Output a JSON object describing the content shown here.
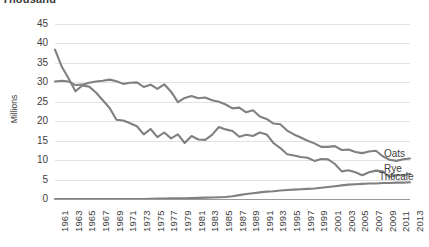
{
  "chart_title": "Thousand",
  "axis": {
    "y_label": "Millions",
    "y_ticks": [
      45,
      40,
      35,
      30,
      25,
      20,
      15,
      10,
      5,
      0
    ],
    "x_ticks": [
      1961,
      1963,
      1965,
      1967,
      1969,
      1971,
      1973,
      1975,
      1977,
      1979,
      1981,
      1983,
      1985,
      1987,
      1989,
      1991,
      1993,
      1995,
      1997,
      1999,
      2001,
      2003,
      2005,
      2007,
      2009,
      2011,
      2013
    ]
  },
  "series_labels": [
    {
      "name": "Oats",
      "text": "Oats"
    },
    {
      "name": "Rye",
      "text": "Rye"
    },
    {
      "name": "Triticale",
      "text": "Triticale"
    }
  ],
  "colors": {
    "line": "#808080",
    "gridline": "#e2e2e2",
    "axis": "#9a9a9a",
    "text": "#3d3d3d",
    "background": "#ffffff"
  },
  "chart_data": {
    "type": "line",
    "title": "Thousand",
    "xlabel": "",
    "ylabel": "Millions",
    "ylim": [
      0,
      45
    ],
    "xlim": [
      1961,
      2013
    ],
    "grid": true,
    "legend": "inline-right-edge",
    "x": [
      1961,
      1962,
      1963,
      1964,
      1965,
      1966,
      1967,
      1968,
      1969,
      1970,
      1971,
      1972,
      1973,
      1974,
      1975,
      1976,
      1977,
      1978,
      1979,
      1980,
      1981,
      1982,
      1983,
      1984,
      1985,
      1986,
      1987,
      1988,
      1989,
      1990,
      1991,
      1992,
      1993,
      1994,
      1995,
      1996,
      1997,
      1998,
      1999,
      2000,
      2001,
      2002,
      2003,
      2004,
      2005,
      2006,
      2007,
      2008,
      2009,
      2010,
      2011,
      2012,
      2013
    ],
    "series": [
      {
        "name": "Oats",
        "values": [
          30.2,
          30.4,
          30.2,
          29.3,
          29.4,
          29.9,
          30.2,
          30.4,
          30.7,
          30.3,
          29.6,
          29.9,
          30.0,
          28.8,
          29.4,
          28.3,
          29.5,
          27.6,
          24.9,
          26.0,
          26.5,
          25.9,
          26.1,
          25.4,
          25.0,
          24.3,
          23.3,
          23.5,
          22.3,
          22.8,
          21.2,
          20.6,
          19.4,
          19.2,
          17.6,
          16.6,
          15.8,
          15.0,
          14.3,
          13.4,
          13.4,
          13.6,
          12.6,
          12.7,
          12.1,
          11.8,
          12.2,
          12.4,
          11.0,
          10.1,
          9.8,
          10.2,
          10.4
        ]
      },
      {
        "name": "Rye",
        "values": [
          38.4,
          34.0,
          31.0,
          27.7,
          29.2,
          28.9,
          27.4,
          25.4,
          23.4,
          20.4,
          20.2,
          19.5,
          18.7,
          16.6,
          18.0,
          15.9,
          17.1,
          15.6,
          16.6,
          14.4,
          16.2,
          15.3,
          15.2,
          16.5,
          18.5,
          17.9,
          17.5,
          16.0,
          16.5,
          16.2,
          17.1,
          16.6,
          14.4,
          13.1,
          11.5,
          11.2,
          10.8,
          10.6,
          9.8,
          10.3,
          10.2,
          9.0,
          7.1,
          7.4,
          6.9,
          6.1,
          6.9,
          7.3,
          7.1,
          5.7,
          6.1,
          6.1,
          6.5
        ]
      },
      {
        "name": "Triticale",
        "values": [
          0.0,
          0.0,
          0.0,
          0.0,
          0.0,
          0.0,
          0.0,
          0.0,
          0.0,
          0.0,
          0.0,
          0.0,
          0.0,
          0.0,
          0.05,
          0.1,
          0.1,
          0.15,
          0.2,
          0.2,
          0.25,
          0.3,
          0.35,
          0.4,
          0.45,
          0.5,
          0.7,
          1.0,
          1.3,
          1.5,
          1.7,
          1.9,
          2.0,
          2.2,
          2.3,
          2.4,
          2.5,
          2.6,
          2.7,
          2.9,
          3.1,
          3.3,
          3.5,
          3.7,
          3.8,
          3.9,
          4.0,
          4.0,
          4.1,
          4.1,
          4.2,
          4.2,
          4.3
        ]
      }
    ]
  }
}
